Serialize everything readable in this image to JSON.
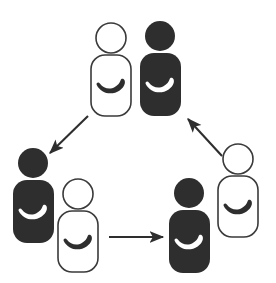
{
  "diagram": {
    "type": "cycle-diagram",
    "background_color": "#ffffff",
    "dark_color": "#2e2e2e",
    "outline_color": "#3a3a3a",
    "light_fill": "#ffffff",
    "stroke_width": 1.6,
    "groups": [
      {
        "id": "group-top",
        "label": "top-pair",
        "figures": [
          {
            "id": "figure-top-light",
            "style": "light",
            "head_cx": 111,
            "head_cy": 38,
            "head_r": 15,
            "body_x": 91,
            "body_y": 55,
            "body_w": 40,
            "body_h": 61,
            "body_r": 14,
            "item": "banana",
            "item_cx": 111,
            "item_cy": 84,
            "item_rot": -40,
            "item_scale": 1.0
          },
          {
            "id": "figure-top-dark",
            "style": "dark",
            "head_cx": 160,
            "head_cy": 36,
            "head_r": 15,
            "body_x": 140,
            "body_y": 53,
            "body_w": 41,
            "body_h": 63,
            "body_r": 14,
            "item": "banana",
            "item_cx": 160,
            "item_cy": 83,
            "item_rot": -40,
            "item_scale": 1.0
          }
        ]
      },
      {
        "id": "group-left",
        "label": "left-pair",
        "figures": [
          {
            "id": "figure-left-dark",
            "style": "dark",
            "head_cx": 33,
            "head_cy": 163,
            "head_r": 15,
            "body_x": 13,
            "body_y": 180,
            "body_w": 41,
            "body_h": 63,
            "body_r": 14,
            "item": "banana",
            "item_cx": 33,
            "item_cy": 210,
            "item_rot": -40,
            "item_scale": 1.0
          },
          {
            "id": "figure-left-light",
            "style": "light",
            "head_cx": 78,
            "head_cy": 194,
            "head_r": 15,
            "body_x": 58,
            "body_y": 211,
            "body_w": 40,
            "body_h": 61,
            "body_r": 14,
            "item": "banana",
            "item_cx": 78,
            "item_cy": 240,
            "item_rot": -40,
            "item_scale": 1.0
          }
        ]
      },
      {
        "id": "group-right",
        "label": "right-pair",
        "figures": [
          {
            "id": "figure-right-dark",
            "style": "dark",
            "head_cx": 189,
            "head_cy": 193,
            "head_r": 15,
            "body_x": 169,
            "body_y": 210,
            "body_w": 41,
            "body_h": 63,
            "body_r": 14,
            "item": "banana",
            "item_cx": 189,
            "item_cy": 240,
            "item_rot": -40,
            "item_scale": 1.0
          },
          {
            "id": "figure-right-light",
            "style": "light",
            "head_cx": 238,
            "head_cy": 159,
            "head_r": 15,
            "body_x": 218,
            "body_y": 176,
            "body_w": 40,
            "body_h": 61,
            "body_r": 14,
            "item": "banana",
            "item_cx": 238,
            "item_cy": 205,
            "item_rot": -40,
            "item_scale": 1.0
          }
        ]
      }
    ],
    "arrows": [
      {
        "id": "arrow-top-to-left",
        "label": "top-to-left",
        "from": "group-top",
        "to": "group-left",
        "x1": 88,
        "y1": 116,
        "x2": 50,
        "y2": 153,
        "direction": "down-left"
      },
      {
        "id": "arrow-left-to-right",
        "label": "left-to-right",
        "from": "group-left",
        "to": "group-right",
        "x1": 109,
        "y1": 237,
        "x2": 163,
        "y2": 237,
        "direction": "right"
      },
      {
        "id": "arrow-right-to-top",
        "label": "right-to-top",
        "from": "group-right",
        "to": "group-top",
        "x1": 222,
        "y1": 156,
        "x2": 188,
        "y2": 119,
        "direction": "up-left"
      }
    ]
  }
}
